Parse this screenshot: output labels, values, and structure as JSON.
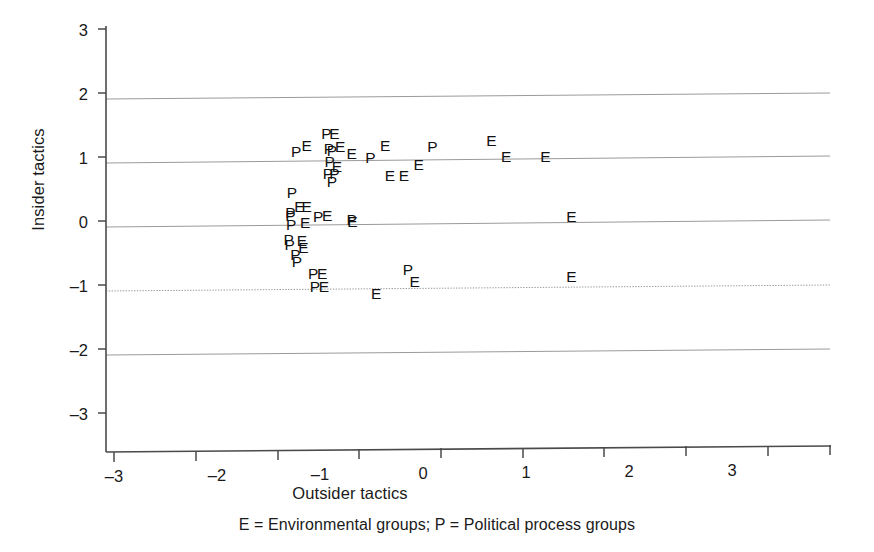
{
  "chart_data": {
    "type": "scatter",
    "title": "",
    "subtitle": "",
    "xlabel": "Outsider tactics",
    "ylabel": "Insider tactics",
    "caption": "E = Environmental groups;   P = Political process groups",
    "xlim": [
      -3,
      3
    ],
    "ylim": [
      -3,
      3
    ],
    "xticks": [
      -3,
      -2,
      -1,
      0,
      1,
      2,
      3
    ],
    "xtick_labels": [
      "–3",
      "–2",
      "–1",
      "0",
      "1",
      "2",
      "3"
    ],
    "yticks": [
      -3,
      -2,
      -1,
      0,
      1,
      2,
      3
    ],
    "ytick_labels": [
      "–3",
      "–2",
      "–1",
      "0",
      "1",
      "2",
      "3"
    ],
    "grid": "horizontal",
    "grid_color": "#9a9a9a",
    "axis_color": "#4a4a4a",
    "marker_style": "text-label",
    "legend": {
      "position": "below-axis",
      "entries": [
        {
          "marker": "E",
          "label": "Environmental groups"
        },
        {
          "marker": "P",
          "label": "Political process groups"
        }
      ]
    },
    "series": [
      {
        "name": "Environmental groups",
        "marker": "E",
        "points": [
          {
            "x": -0.64,
            "y": 1.14
          },
          {
            "x": -0.3,
            "y": 1.33
          },
          {
            "x": -0.23,
            "y": 1.13
          },
          {
            "x": -0.09,
            "y": 1.02
          },
          {
            "x": 0.32,
            "y": 1.14
          },
          {
            "x": 0.73,
            "y": 0.84
          },
          {
            "x": 1.62,
            "y": 1.2
          },
          {
            "x": 1.8,
            "y": 0.95
          },
          {
            "x": 2.28,
            "y": 0.95
          },
          {
            "x": -0.27,
            "y": 0.81
          },
          {
            "x": 0.38,
            "y": 0.66
          },
          {
            "x": 0.55,
            "y": 0.66
          },
          {
            "x": -0.73,
            "y": 0.2
          },
          {
            "x": -0.64,
            "y": 0.2
          },
          {
            "x": -0.66,
            "y": -0.06
          },
          {
            "x": -0.39,
            "y": 0.05
          },
          {
            "x": -0.08,
            "y": -0.04
          },
          {
            "x": -0.7,
            "y": -0.33
          },
          {
            "x": -0.68,
            "y": -0.44
          },
          {
            "x": 2.6,
            "y": 0.0
          },
          {
            "x": -0.45,
            "y": -0.86
          },
          {
            "x": -0.43,
            "y": -1.06
          },
          {
            "x": 0.68,
            "y": -1.0
          },
          {
            "x": 0.21,
            "y": -1.17
          },
          {
            "x": 2.6,
            "y": -0.94
          }
        ]
      },
      {
        "name": "Political process groups",
        "marker": "P",
        "points": [
          {
            "x": -0.77,
            "y": 1.05
          },
          {
            "x": -0.4,
            "y": 1.33
          },
          {
            "x": -0.37,
            "y": 1.09
          },
          {
            "x": -0.33,
            "y": 1.07
          },
          {
            "x": -0.36,
            "y": 0.89
          },
          {
            "x": 0.14,
            "y": 0.95
          },
          {
            "x": 0.9,
            "y": 1.11
          },
          {
            "x": -0.38,
            "y": 0.7
          },
          {
            "x": -0.3,
            "y": 0.7
          },
          {
            "x": -0.33,
            "y": 0.58
          },
          {
            "x": -0.82,
            "y": 0.41
          },
          {
            "x": -0.84,
            "y": 0.1
          },
          {
            "x": -0.84,
            "y": 0.05
          },
          {
            "x": -0.83,
            "y": -0.08
          },
          {
            "x": -0.86,
            "y": -0.32
          },
          {
            "x": -0.85,
            "y": -0.4
          },
          {
            "x": -0.78,
            "y": -0.55
          },
          {
            "x": -0.76,
            "y": -0.66
          },
          {
            "x": -0.5,
            "y": 0.04
          },
          {
            "x": -0.09,
            "y": -0.02
          },
          {
            "x": -0.56,
            "y": -0.86
          },
          {
            "x": -0.54,
            "y": -1.06
          },
          {
            "x": 0.6,
            "y": -0.8
          }
        ]
      }
    ]
  }
}
